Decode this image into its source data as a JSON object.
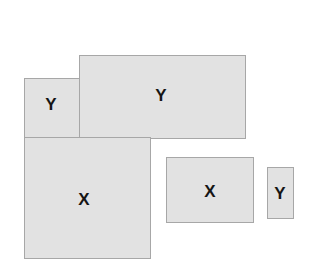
{
  "figure": {
    "background_color": "#ffffff",
    "canvas": {
      "width": 319,
      "height": 265
    },
    "shape_fill_color": "#e2e2e2",
    "shape_border_color": "#a7a7a7",
    "label_color": "#151515",
    "shapes": [
      {
        "id": "rect-y-left",
        "label": "Y",
        "x": 24,
        "y": 78,
        "width": 56,
        "height": 60,
        "label_x": 51,
        "label_y": 104,
        "label_size": 17
      },
      {
        "id": "rect-y-top",
        "label": "Y",
        "x": 79,
        "y": 55,
        "width": 167,
        "height": 84,
        "label_x": 161,
        "label_y": 95,
        "label_size": 17
      },
      {
        "id": "rect-x-large",
        "label": "X",
        "x": 24,
        "y": 137,
        "width": 127,
        "height": 122,
        "label_x": 84,
        "label_y": 199,
        "label_size": 17
      },
      {
        "id": "rect-x-middle",
        "label": "X",
        "x": 166,
        "y": 157,
        "width": 88,
        "height": 66,
        "label_x": 210,
        "label_y": 191,
        "label_size": 17
      },
      {
        "id": "rect-y-right",
        "label": "Y",
        "x": 267,
        "y": 167,
        "width": 27,
        "height": 52,
        "label_x": 280,
        "label_y": 193,
        "label_size": 17
      }
    ]
  }
}
